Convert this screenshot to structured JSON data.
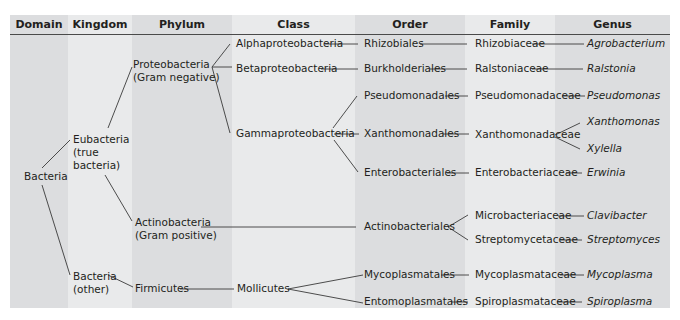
{
  "headers": {
    "domain": "Domain",
    "kingdom": "Kingdom",
    "phylum": "Phylum",
    "class": "Class",
    "order": "Order",
    "family": "Family",
    "genus": "Genus"
  },
  "domain": {
    "bacteria": "Bacteria"
  },
  "kingdom": {
    "eubacteria": [
      "Eubacteria",
      "(true",
      "bacteria)"
    ],
    "bacteria_other": [
      "Bacteria",
      "(other)"
    ]
  },
  "phylum": {
    "proteobacteria": [
      "Proteobacteria",
      "(Gram negative)"
    ],
    "actinobacteria": [
      "Actinobacteria",
      "(Gram positive)"
    ],
    "firmicutes": "Firmicutes"
  },
  "class": {
    "alpha": "Alphaproteobacteria",
    "beta": "Betaproteobacteria",
    "gamma": "Gammaproteobacteria",
    "mollicutes": "Mollicutes"
  },
  "order": {
    "rhizobiales": "Rhizobiales",
    "burkholderiales": "Burkholderiales",
    "pseudomonadales": "Pseudomonadales",
    "xanthomonadales": "Xanthomonadales",
    "enterobacteriales": "Enterobacteriales",
    "actinobacteriales": "Actinobacteriales",
    "mycoplasmatales": "Mycoplasmatales",
    "entomoplasmatales": "Entomoplasmatales"
  },
  "family": {
    "rhizobiaceae": "Rhizobiaceae",
    "ralstoniaceae": "Ralstoniaceae",
    "pseudomonadaceae": "Pseudomonadaceae",
    "xanthomonadaceae": "Xanthomonadaceae",
    "enterobacteriaceae": "Enterobacteriaceae",
    "microbacteriaceae": "Microbacteriaceae",
    "streptomycetaceae": "Streptomycetaceae",
    "mycoplasmataceae": "Mycoplasmataceae",
    "spiroplasmataceae": "Spiroplasmataceae"
  },
  "genus": {
    "agrobacterium": "Agrobacterium",
    "ralstonia": "Ralstonia",
    "pseudomonas": "Pseudomonas",
    "xanthomonas": "Xanthomonas",
    "xylella": "Xylella",
    "erwinia": "Erwinia",
    "clavibacter": "Clavibacter",
    "streptomyces": "Streptomyces",
    "mycoplasma": "Mycoplasma",
    "spiroplasma": "Spiroplasma"
  },
  "colors": {
    "stripe_dark": "#dcdddf",
    "stripe_light": "#e9eaeb",
    "text": "#231f20",
    "rule": "#4a4a4a"
  }
}
